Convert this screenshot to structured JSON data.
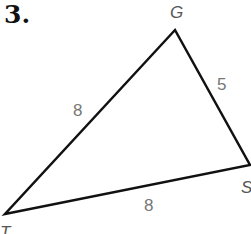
{
  "problem": {
    "number": "3."
  },
  "triangle": {
    "vertices": [
      {
        "name": "G",
        "x": 175,
        "y": 30
      },
      {
        "name": "S",
        "x": 250,
        "y": 165
      },
      {
        "name": "T",
        "x": 5,
        "y": 214
      }
    ],
    "sides": [
      {
        "segment": "GT",
        "length": "8"
      },
      {
        "segment": "GS",
        "length": "5"
      },
      {
        "segment": "TS",
        "length": "8"
      }
    ],
    "stroke_color": "#111111",
    "label_color": "#777777"
  }
}
